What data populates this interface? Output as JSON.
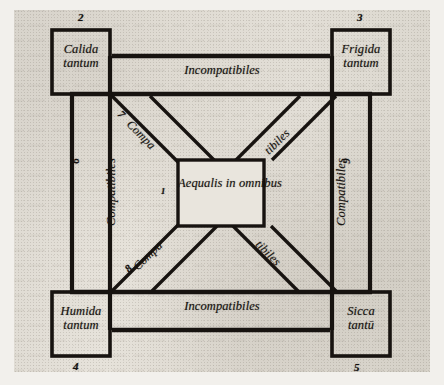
{
  "figure": {
    "title": "Aequalis in omnibus",
    "language": "Latin",
    "kind": "square-of-opposition-compatibility-diagram"
  },
  "center": {
    "line1": "Aequalis in",
    "line2": "omnibus",
    "marker": "1"
  },
  "corners": [
    {
      "id": "top-left",
      "line1": "Calida",
      "line2": "tantum",
      "marker": "2"
    },
    {
      "id": "top-right",
      "line1": "Frigida",
      "line2": "tantum",
      "marker": "3"
    },
    {
      "id": "bottom-left",
      "line1": "Humida",
      "line2": "tantum",
      "marker": "4"
    },
    {
      "id": "bottom-right",
      "line1": "Sicca",
      "line2": "tantū",
      "marker": "5"
    }
  ],
  "bands": {
    "top": {
      "label": "Incompatibiles",
      "marker": ""
    },
    "bottom": {
      "label": "Incompatibiles",
      "marker": ""
    },
    "left": {
      "label": "Compatibiles",
      "marker": "6"
    },
    "right": {
      "label": "Compatibiles",
      "marker": "9"
    }
  },
  "diagonals": [
    {
      "id": "upper-left",
      "label": "Compa",
      "marker": "7"
    },
    {
      "id": "upper-right",
      "label": "tibiles",
      "marker": ""
    },
    {
      "id": "lower-left",
      "label": "Compa",
      "marker": "8"
    },
    {
      "id": "lower-right",
      "label": "tibiles",
      "marker": ""
    }
  ],
  "colors": {
    "ink": "#171310",
    "paper": "#e2ded6",
    "margin": "#f2f0ec"
  }
}
